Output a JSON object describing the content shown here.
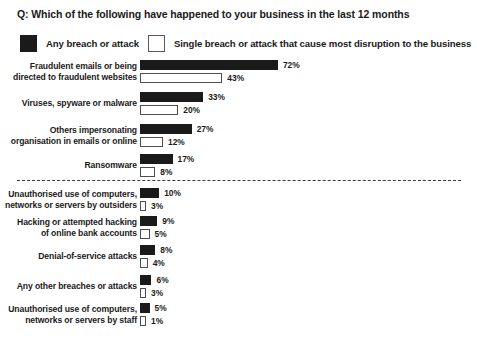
{
  "title": "Q: Which of the following have happened to your business in the last 12 months",
  "legend": {
    "items": [
      {
        "label": "Any breach or attack",
        "swatch": "dark",
        "color": "#1a1a1a"
      },
      {
        "label": "Single breach or attack that cause most disruption to the business",
        "swatch": "light",
        "color": "#ffffff"
      }
    ]
  },
  "divider": {
    "style": "dashed",
    "color": "#3c3c3c"
  },
  "chart_data": {
    "type": "bar",
    "orientation": "horizontal",
    "title": "Q: Which of the following have happened to your business in the last 12 months",
    "xlabel": "",
    "ylabel": "",
    "xlim": [
      0,
      80
    ],
    "grid": false,
    "legend_position": "top",
    "value_suffix": "%",
    "categories": [
      "Fraudulent emails or being directed to fraudulent websites",
      "Viruses, spyware or malware",
      "Others impersonating organisation in emails or online",
      "Ransomware",
      "Unauthorised use of computers, networks or servers by outsiders",
      "Hacking or attempted hacking of online bank accounts",
      "Denial-of-service attacks",
      "Any other breaches or attacks",
      "Unauthorised use of computers, networks or servers by staff"
    ],
    "series": [
      {
        "name": "Any breach or attack",
        "color": "#1a1a1a",
        "values": [
          72,
          33,
          27,
          17,
          10,
          9,
          8,
          6,
          5
        ]
      },
      {
        "name": "Single breach or attack that cause most disruption to the business",
        "color": "#ffffff",
        "values": [
          43,
          20,
          12,
          8,
          3,
          5,
          4,
          3,
          1
        ]
      }
    ]
  },
  "rows": [
    {
      "label_line1": "Fraudulent emails or being",
      "label_line2": "directed to fraudulent websites",
      "dark": 72,
      "dark_text": "72%",
      "light": 43,
      "light_text": "43%",
      "top": 60
    },
    {
      "label_line1": "Viruses, spyware or malware",
      "label_line2": "",
      "dark": 33,
      "dark_text": "33%",
      "light": 20,
      "light_text": "20%",
      "top": 92
    },
    {
      "label_line1": "Others impersonating",
      "label_line2": "organisation in emails or online",
      "dark": 27,
      "dark_text": "27%",
      "light": 12,
      "light_text": "12%",
      "top": 124
    },
    {
      "label_line1": "Ransomware",
      "label_line2": "",
      "dark": 17,
      "dark_text": "17%",
      "light": 8,
      "light_text": "8%",
      "top": 154
    },
    {
      "label_line1": "Unauthorised use of computers,",
      "label_line2": "networks or servers by outsiders",
      "dark": 10,
      "dark_text": "10%",
      "light": 3,
      "light_text": "3%",
      "top": 188
    },
    {
      "label_line1": "Hacking or attempted hacking",
      "label_line2": "of online bank accounts",
      "dark": 9,
      "dark_text": "9%",
      "light": 5,
      "light_text": "5%",
      "top": 216
    },
    {
      "label_line1": "Denial-of-service attacks",
      "label_line2": "",
      "dark": 8,
      "dark_text": "8%",
      "light": 4,
      "light_text": "4%",
      "top": 245
    },
    {
      "label_line1": "Any other breaches or attacks",
      "label_line2": "",
      "dark": 6,
      "dark_text": "6%",
      "light": 3,
      "light_text": "3%",
      "top": 275
    },
    {
      "label_line1": "Unauthorised use of computers,",
      "label_line2": "networks or servers by staff",
      "dark": 5,
      "dark_text": "5%",
      "light": 1,
      "light_text": "1%",
      "top": 303
    }
  ]
}
